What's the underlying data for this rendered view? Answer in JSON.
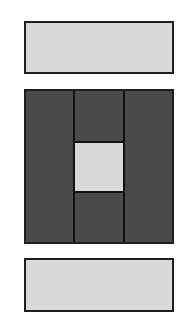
{
  "diagram": {
    "colors": {
      "light_fill": "#d9d9d9",
      "dark_fill": "#4a4a4a",
      "stroke": "#1e1e1e",
      "background": "#ffffff"
    },
    "shapes": [
      {
        "id": "top-bar",
        "type": "rect",
        "x": 24,
        "y": 21,
        "w": 150,
        "h": 53,
        "fill": "light"
      },
      {
        "id": "middle-block",
        "type": "rect",
        "x": 24,
        "y": 89,
        "w": 150,
        "h": 155,
        "fill": "dark",
        "dividers_x": [
          73,
          123
        ],
        "center_square": {
          "x": 73,
          "y": 141,
          "w": 52,
          "h": 52,
          "fill": "light"
        }
      },
      {
        "id": "bottom-bar",
        "type": "rect",
        "x": 24,
        "y": 258,
        "w": 150,
        "h": 54,
        "fill": "light"
      }
    ]
  }
}
